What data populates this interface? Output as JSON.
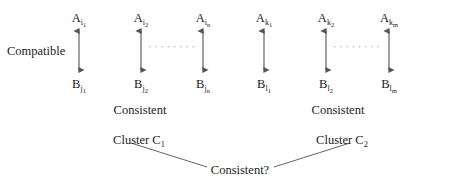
{
  "figure": {
    "background_color": "#ffffff",
    "stroke_color": "#555555",
    "text_color": "#1c1c1c",
    "width": 449,
    "height": 186
  },
  "left_edge_label": "Compatible",
  "clusters": [
    {
      "name": "cluster-1",
      "cluster_label_prefix": "Cluster C",
      "cluster_label_sub": "1",
      "relation_label": "Consistent",
      "top_nodes": [
        {
          "base": "A",
          "sub": "i",
          "subsub": "1"
        },
        {
          "base": "A",
          "sub": "i",
          "subsub": "2"
        },
        {
          "base": "A",
          "sub": "i",
          "subsub": "n"
        }
      ],
      "bottom_nodes": [
        {
          "base": "B",
          "sub": "j",
          "subsub": "1"
        },
        {
          "base": "B",
          "sub": "j",
          "subsub": "2"
        },
        {
          "base": "B",
          "sub": "j",
          "subsub": "n"
        }
      ],
      "ellipsis": "• • • • • • • •"
    },
    {
      "name": "cluster-2",
      "cluster_label_prefix": "Cluster C",
      "cluster_label_sub": "2",
      "relation_label": "Consistent",
      "top_nodes": [
        {
          "base": "A",
          "sub": "k",
          "subsub": "1"
        },
        {
          "base": "A",
          "sub": "k",
          "subsub": "2"
        },
        {
          "base": "A",
          "sub": "k",
          "subsub": "m"
        }
      ],
      "bottom_nodes": [
        {
          "base": "B",
          "sub": "l",
          "subsub": "1"
        },
        {
          "base": "B",
          "sub": "l",
          "subsub": "2"
        },
        {
          "base": "B",
          "sub": "l",
          "subsub": "m"
        }
      ],
      "ellipsis": "• • • • • • • •"
    }
  ],
  "bottom_question_label": "Consistent?"
}
